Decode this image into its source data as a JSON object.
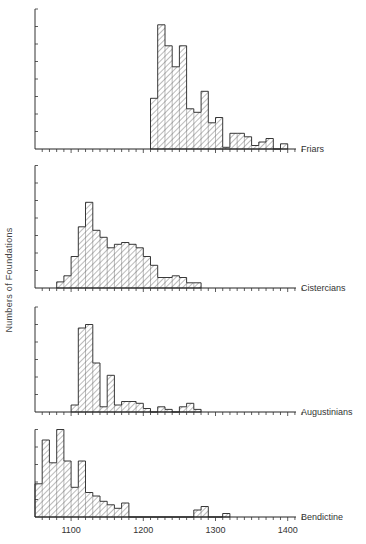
{
  "chart_data": {
    "type": "bar",
    "subtype": "stacked-panel histograms",
    "title": "",
    "ylabel": "Numbers of Foundations",
    "xlabel": "",
    "x_axis": {
      "ticks": [
        1100,
        1200,
        1300,
        1400
      ],
      "range": [
        1050,
        1425
      ],
      "bin_width_years": 10,
      "minor_tick_every": 10
    },
    "y_axis": {
      "tick_labels": "none (unlabeled ticks)",
      "units": "tick intervals (relative counts)"
    },
    "grid": false,
    "legend": "none; each panel labelled at right end of its x-axis",
    "panels": [
      {
        "name": "Friars",
        "y_ticks": 8,
        "bins_start": 1210,
        "values": [
          2.9,
          7.1,
          5.9,
          4.7,
          5.9,
          2.3,
          2.1,
          3.3,
          1.5,
          1.8,
          0.1,
          0.9,
          0.9,
          0.7,
          0.2,
          0.4,
          0.6,
          0,
          0.3
        ]
      },
      {
        "name": "Cistercians",
        "y_ticks": 7,
        "bins_start": 1080,
        "values": [
          0.35,
          0.7,
          1.8,
          3.5,
          4.9,
          3.3,
          2.9,
          2.3,
          2.5,
          2.6,
          2.5,
          2.3,
          1.8,
          1.3,
          0.6,
          0.6,
          0.7,
          0.6,
          0.3,
          0.3
        ]
      },
      {
        "name": "Augustinians",
        "y_ticks": 6,
        "bins_start": 1100,
        "values": [
          0.4,
          4.8,
          5.0,
          2.8,
          0.3,
          2.1,
          0.4,
          0.6,
          0.6,
          0.5,
          0.2,
          0,
          0.3,
          0.15,
          0,
          0.3,
          0.5,
          0.15
        ]
      },
      {
        "name": "Bendictine",
        "y_ticks": 5,
        "bins_start": 1050,
        "values": [
          1.9,
          4.4,
          3.1,
          5.0,
          3.2,
          1.7,
          3.2,
          1.4,
          1.2,
          0.9,
          0.7,
          0.5,
          0.8,
          0,
          0,
          0,
          0,
          0,
          0,
          0,
          0,
          0,
          0.4,
          0.6,
          0,
          0,
          0.2
        ]
      }
    ]
  }
}
